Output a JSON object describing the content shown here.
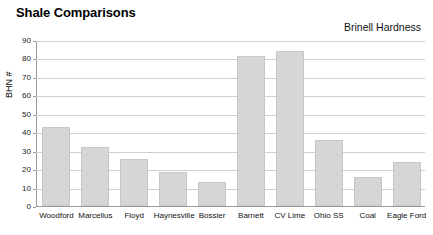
{
  "chart_data": {
    "type": "bar",
    "title": "Shale Comparisons",
    "subtitle": "Brinell Hardness",
    "xlabel": "",
    "ylabel": "BHN #",
    "ylim": [
      0,
      90
    ],
    "ytick_step": 10,
    "yticks": [
      90,
      80,
      70,
      60,
      50,
      40,
      30,
      20,
      10,
      0
    ],
    "grid": true,
    "legend": "none",
    "bar_color": "#d6d6d6",
    "bar_border_color": "#c8c8c8",
    "gridline_color": "#cfcfcf",
    "axis_color": "#9a9a9a",
    "categories": [
      "Woodford",
      "Marcellus",
      "Floyd",
      "Haynesville",
      "Bossier",
      "Barnett",
      "CV Lime",
      "Ohio SS",
      "Coal",
      "Eagle Ford"
    ],
    "values": [
      43,
      32,
      25.5,
      18.5,
      13,
      81.5,
      84,
      36,
      16,
      24
    ]
  }
}
